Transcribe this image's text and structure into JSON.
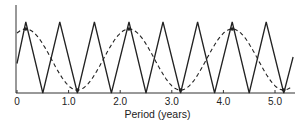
{
  "chart_data": {
    "type": "line",
    "title": "",
    "xlabel": "Period (years)",
    "ylabel": "",
    "xlim": [
      0,
      5.3
    ],
    "grid": false,
    "legend": null,
    "x_ticks": [
      0,
      1.0,
      2.0,
      3.0,
      4.0,
      5.0
    ],
    "x_tick_labels": [
      "0",
      "1.0",
      "2.0",
      "3.0",
      "4.0",
      "5.0"
    ],
    "series": [
      {
        "name": "short-period cycle",
        "style": "solid",
        "color": "#222222",
        "shape": "triangular oscillation",
        "period_years": 0.667,
        "peaks_x": [
          0.17,
          0.83,
          1.5,
          2.17,
          2.83,
          3.5,
          4.17,
          4.83
        ],
        "troughs_x": [
          0.5,
          1.17,
          1.83,
          2.5,
          3.17,
          3.83,
          4.5,
          5.17
        ],
        "amplitude_relative": 1.0
      },
      {
        "name": "long-period cycle",
        "style": "dashed",
        "color": "#222222",
        "shape": "sinusoid",
        "period_years": 2.0,
        "peaks_x": [
          0.17,
          2.17,
          4.17
        ],
        "troughs_x": [
          1.17,
          3.17,
          5.17
        ],
        "amplitude_relative": 0.9,
        "marked_points_x": [
          0.17,
          1.17,
          2.17,
          3.17,
          4.17,
          5.17
        ]
      }
    ]
  }
}
